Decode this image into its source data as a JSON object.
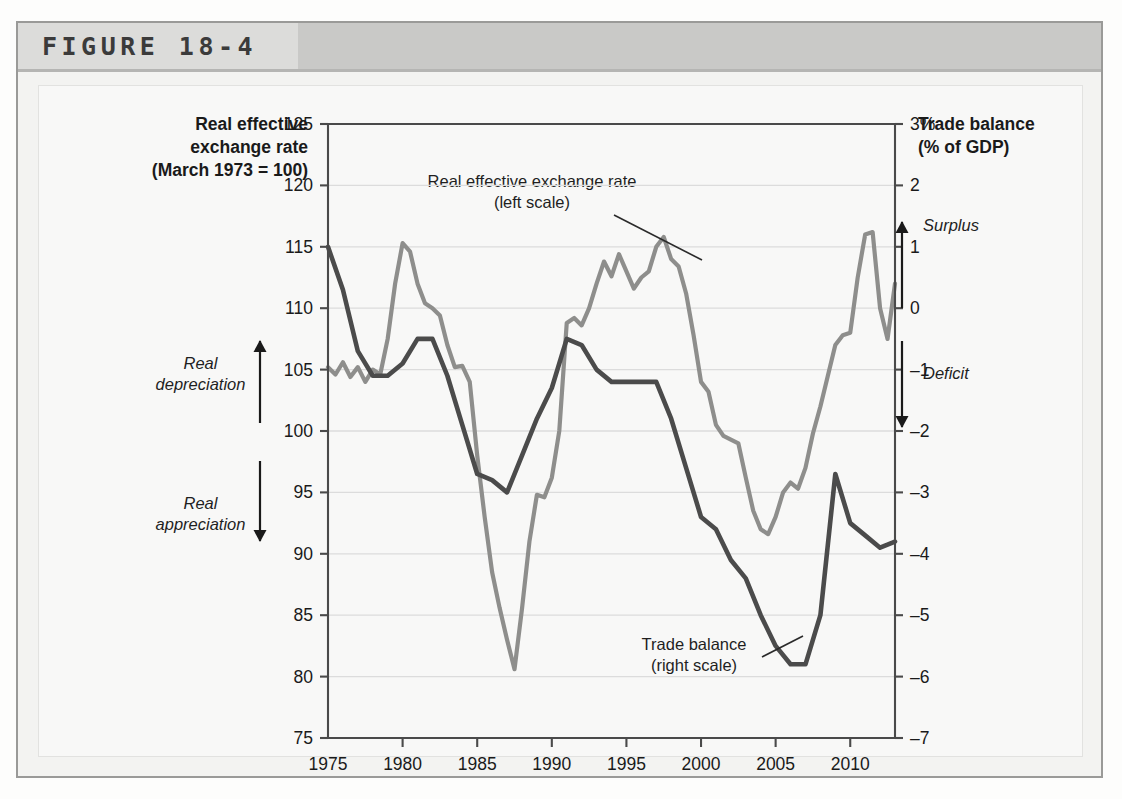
{
  "figure": {
    "title": "FIGURE 18-4"
  },
  "axes": {
    "left_title_lines": [
      "Real effective",
      "exchange rate",
      "(March 1973 = 100)"
    ],
    "right_title_lines": [
      "Trade balance",
      "(% of GDP)"
    ],
    "left_ticks": [
      "125",
      "120",
      "115",
      "110",
      "105",
      "100",
      "95",
      "90",
      "85",
      "80",
      "75"
    ],
    "right_ticks": [
      "3%",
      "2",
      "1",
      "0",
      "-1",
      "-2",
      "-3",
      "-4",
      "-5",
      "-6",
      "-7"
    ],
    "x_ticks": [
      "1975",
      "1980",
      "1985",
      "1990",
      "1995",
      "2000",
      "2005",
      "2010"
    ]
  },
  "annotations": {
    "real_depreciation": [
      "Real",
      "depreciation"
    ],
    "real_appreciation": [
      "Real",
      "appreciation"
    ],
    "surplus": "Surplus",
    "deficit": "Deficit",
    "callout_fx": [
      "Real effective exchange rate",
      "(left scale)"
    ],
    "callout_tb": [
      "Trade balance",
      "(right scale)"
    ]
  },
  "colors": {
    "exchange_rate_line": "#8e8e8c",
    "trade_balance_line": "#4b4b4b",
    "gridline": "#dcdcdc",
    "axis": "#4a4a4a",
    "header_band": "#c9c9c7",
    "figure_bg": "#f3f3f1",
    "plot_bg": "#fbfbfa"
  },
  "chart_data": {
    "type": "line",
    "title": "FIGURE 18-4",
    "xlabel": "",
    "grid": true,
    "legend_position": "inline-callouts",
    "xlim": [
      1975,
      2013
    ],
    "x_tick_values": [
      1975,
      1980,
      1985,
      1990,
      1995,
      2000,
      2005,
      2010
    ],
    "axes": {
      "left": {
        "label": "Real effective exchange rate (March 1973 = 100)",
        "ylim": [
          75,
          125
        ],
        "ticks": [
          75,
          80,
          85,
          90,
          95,
          100,
          105,
          110,
          115,
          120,
          125
        ]
      },
      "right": {
        "label": "Trade balance (% of GDP)",
        "ylim": [
          -7,
          3
        ],
        "ticks": [
          -7,
          -6,
          -5,
          -4,
          -3,
          -2,
          -1,
          0,
          1,
          2,
          3
        ],
        "unit": "%"
      }
    },
    "series": [
      {
        "name": "Real effective exchange rate (left scale)",
        "axis": "left",
        "color": "#8e8e8c",
        "x": [
          1975,
          1975.5,
          1976,
          1976.5,
          1977,
          1977.5,
          1978,
          1978.5,
          1979,
          1979.5,
          1980,
          1980.5,
          1981,
          1981.5,
          1982,
          1982.5,
          1983,
          1983.5,
          1984,
          1984.5,
          1985,
          1985.5,
          1986,
          1986.5,
          1987,
          1987.5,
          1988,
          1988.5,
          1989,
          1989.5,
          1990,
          1990.5,
          1991,
          1991.5,
          1992,
          1992.5,
          1993,
          1993.5,
          1994,
          1994.5,
          1995,
          1995.5,
          1996,
          1996.5,
          1997,
          1997.5,
          1998,
          1998.5,
          1999,
          1999.5,
          2000,
          2000.5,
          2001,
          2001.5,
          2002,
          2002.5,
          2003,
          2003.5,
          2004,
          2004.5,
          2005,
          2005.5,
          2006,
          2006.5,
          2007,
          2007.5,
          2008,
          2008.5,
          2009,
          2009.5,
          2010,
          2010.5,
          2011,
          2011.5,
          2012,
          2012.5,
          2013
        ],
        "y": [
          105.2,
          104.6,
          105.6,
          104.4,
          105.2,
          104.0,
          105.0,
          104.6,
          107.5,
          112.0,
          115.3,
          114.6,
          112.0,
          110.4,
          110.0,
          109.4,
          107.0,
          105.2,
          105.3,
          104.0,
          98.0,
          93.0,
          88.5,
          85.6,
          83.0,
          80.6,
          85.5,
          91.0,
          94.8,
          94.6,
          96.2,
          100.0,
          108.8,
          109.2,
          108.6,
          110.0,
          112.0,
          113.8,
          112.6,
          114.4,
          113.0,
          111.6,
          112.5,
          113.0,
          115.0,
          115.8,
          114.0,
          113.4,
          111.2,
          107.8,
          104.0,
          103.2,
          100.5,
          99.6,
          99.3,
          99.0,
          96.2,
          93.5,
          92.0,
          91.6,
          93.0,
          95.0,
          95.8,
          95.3,
          97.0,
          99.8,
          102.0,
          104.5,
          107.0,
          107.8,
          108.0,
          112.5,
          116.0,
          116.2,
          110.0,
          107.5,
          112.0
        ]
      },
      {
        "name": "Trade balance (right scale)",
        "axis": "right",
        "color": "#4b4b4b",
        "x": [
          1975,
          1976,
          1977,
          1978,
          1979,
          1980,
          1981,
          1982,
          1983,
          1984,
          1985,
          1986,
          1987,
          1988,
          1989,
          1990,
          1991,
          1992,
          1993,
          1994,
          1995,
          1996,
          1997,
          1998,
          1999,
          2000,
          2001,
          2002,
          2003,
          2004,
          2005,
          2006,
          2007,
          2008,
          2009,
          2010,
          2011,
          2012,
          2013
        ],
        "y": [
          1.0,
          0.3,
          -0.7,
          -1.1,
          -1.1,
          -0.9,
          -0.5,
          -0.5,
          -1.1,
          -1.9,
          -2.7,
          -2.8,
          -3.0,
          -2.4,
          -1.8,
          -1.3,
          -0.5,
          -0.6,
          -1.0,
          -1.2,
          -1.2,
          -1.2,
          -1.2,
          -1.8,
          -2.6,
          -3.4,
          -3.6,
          -4.1,
          -4.4,
          -5.0,
          -5.5,
          -5.8,
          -5.8,
          -5.0,
          -2.7,
          -3.5,
          -3.7,
          -3.9,
          -3.8
        ]
      }
    ]
  }
}
